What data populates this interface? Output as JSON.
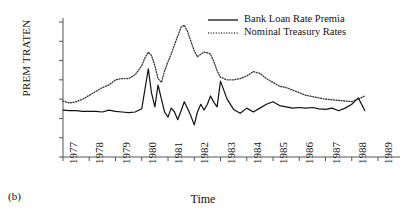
{
  "caption": "(b)",
  "chart_data": {
    "type": "line",
    "title": "",
    "xlabel": "Time",
    "ylabel": "PREM TRATEN",
    "xlim": [
      1977,
      1989
    ],
    "ylim": [
      -0.03,
      0.18
    ],
    "grid": false,
    "legend_position": "top-right",
    "xticks": [
      "1977",
      "1978",
      "1979",
      "1980",
      "1981",
      "1982",
      "1983",
      "1984",
      "1985",
      "1986",
      "1987",
      "1988",
      "1989"
    ],
    "yticks": [
      "0.18",
      "0.15",
      "0.12",
      "0.09",
      "0.06",
      "0.03",
      "0.00",
      "−0.03"
    ],
    "ytick_values": [
      0.18,
      0.15,
      0.12,
      0.09,
      0.06,
      0.03,
      0.0,
      -0.03
    ],
    "series": [
      {
        "name": "Bank Loan Rate Premia",
        "style": "solid",
        "color": "#111111",
        "x": [
          1977.0,
          1977.25,
          1977.5,
          1977.75,
          1978.0,
          1978.25,
          1978.5,
          1978.75,
          1979.0,
          1979.25,
          1979.5,
          1979.75,
          1980.0,
          1980.12,
          1980.25,
          1980.37,
          1980.5,
          1980.62,
          1980.75,
          1980.87,
          1981.0,
          1981.12,
          1981.25,
          1981.37,
          1981.5,
          1981.62,
          1981.75,
          1981.87,
          1982.0,
          1982.12,
          1982.25,
          1982.37,
          1982.5,
          1982.62,
          1982.75,
          1982.87,
          1983.0,
          1983.25,
          1983.5,
          1983.75,
          1984.0,
          1984.25,
          1984.5,
          1984.75,
          1985.0,
          1985.25,
          1985.5,
          1985.75,
          1986.0,
          1986.25,
          1986.5,
          1986.75,
          1987.0,
          1987.25,
          1987.5,
          1987.75,
          1988.0,
          1988.25,
          1988.5
        ],
        "y": [
          0.043,
          0.042,
          0.042,
          0.041,
          0.041,
          0.041,
          0.04,
          0.043,
          0.041,
          0.04,
          0.039,
          0.04,
          0.045,
          0.075,
          0.107,
          0.07,
          0.048,
          0.082,
          0.06,
          0.04,
          0.032,
          0.046,
          0.04,
          0.028,
          0.042,
          0.056,
          0.045,
          0.034,
          0.02,
          0.04,
          0.052,
          0.043,
          0.052,
          0.065,
          0.055,
          0.048,
          0.088,
          0.06,
          0.044,
          0.038,
          0.046,
          0.04,
          0.046,
          0.052,
          0.056,
          0.05,
          0.048,
          0.046,
          0.047,
          0.046,
          0.047,
          0.045,
          0.044,
          0.046,
          0.042,
          0.046,
          0.052,
          0.062,
          0.042
        ]
      },
      {
        "name": "Nominal Treasury Rates",
        "style": "dotted",
        "color": "#333333",
        "x": [
          1977.0,
          1977.25,
          1977.5,
          1977.75,
          1978.0,
          1978.25,
          1978.5,
          1978.75,
          1979.0,
          1979.25,
          1979.5,
          1979.75,
          1980.0,
          1980.12,
          1980.25,
          1980.37,
          1980.5,
          1980.62,
          1980.75,
          1980.87,
          1981.0,
          1981.12,
          1981.25,
          1981.37,
          1981.5,
          1981.62,
          1981.75,
          1981.87,
          1982.0,
          1982.12,
          1982.25,
          1982.37,
          1982.5,
          1982.62,
          1982.75,
          1982.87,
          1983.0,
          1983.25,
          1983.5,
          1983.75,
          1984.0,
          1984.25,
          1984.5,
          1984.75,
          1985.0,
          1985.25,
          1985.5,
          1985.75,
          1986.0,
          1986.25,
          1986.5,
          1986.75,
          1987.0,
          1987.25,
          1987.5,
          1987.75,
          1988.0,
          1988.25,
          1988.5
        ],
        "y": [
          0.057,
          0.054,
          0.056,
          0.06,
          0.066,
          0.072,
          0.078,
          0.082,
          0.09,
          0.092,
          0.092,
          0.098,
          0.112,
          0.124,
          0.133,
          0.128,
          0.112,
          0.092,
          0.086,
          0.104,
          0.118,
          0.13,
          0.145,
          0.158,
          0.172,
          0.175,
          0.165,
          0.15,
          0.135,
          0.126,
          0.13,
          0.133,
          0.132,
          0.13,
          0.118,
          0.104,
          0.094,
          0.09,
          0.09,
          0.092,
          0.096,
          0.103,
          0.1,
          0.092,
          0.086,
          0.08,
          0.078,
          0.074,
          0.07,
          0.066,
          0.064,
          0.062,
          0.06,
          0.059,
          0.058,
          0.057,
          0.056,
          0.06,
          0.065
        ]
      }
    ]
  }
}
